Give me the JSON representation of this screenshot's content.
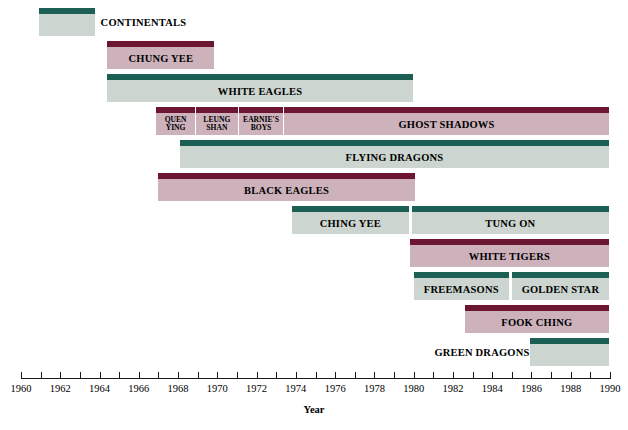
{
  "chart_data": {
    "type": "bar",
    "orientation": "horizontal-timeline",
    "title": "",
    "xlabel": "Year",
    "ylabel": "",
    "xlim": [
      1960,
      1990
    ],
    "grid": false,
    "legend": null,
    "tick_step": 1,
    "label_step": 2,
    "tick_labels": [
      "1960",
      "1961",
      "1962",
      "1963",
      "1964",
      "1965",
      "1966",
      "1967",
      "1968",
      "1969",
      "1970",
      "1971",
      "1972",
      "1973",
      "1974",
      "1975",
      "1976",
      "1977",
      "1978",
      "1979",
      "1980",
      "1981",
      "1982",
      "1983",
      "1984",
      "1985",
      "1986",
      "1987",
      "1988",
      "1989",
      "1990"
    ],
    "visible_tick_labels": [
      "1960",
      "1962",
      "1964",
      "1966",
      "1968",
      "1970",
      "1972",
      "1974",
      "1976",
      "1978",
      "1980",
      "1982",
      "1984",
      "1986",
      "1988",
      "1990"
    ],
    "colors": {
      "green_cap": "#1c5f54",
      "green_body": "#ccd5cf",
      "maroon_cap": "#6c1631",
      "maroon_body": "#cdb2bb",
      "axis": "#1a1a1a",
      "text": "#000000",
      "background": "#ffffff"
    },
    "rows": [
      {
        "row": 0,
        "segments": [
          {
            "label": "CONTINENTALS",
            "start": 1960.9,
            "end": 1963.8,
            "color": "green",
            "label_position": "right-outside",
            "label_size": "normal"
          }
        ]
      },
      {
        "row": 1,
        "segments": [
          {
            "label": "CHUNG YEE",
            "start": 1964.4,
            "end": 1969.9,
            "color": "maroon",
            "label_position": "inside",
            "label_size": "normal"
          }
        ]
      },
      {
        "row": 2,
        "segments": [
          {
            "label": "WHITE EAGLES",
            "start": 1964.4,
            "end": 1980.0,
            "color": "green",
            "label_position": "inside",
            "label_size": "normal"
          }
        ]
      },
      {
        "row": 3,
        "segments": [
          {
            "label": "QUEN YING",
            "start": 1966.9,
            "end": 1968.9,
            "color": "maroon",
            "label_position": "inside",
            "label_size": "small",
            "label_lines": [
              "QUEN",
              "YING"
            ]
          },
          {
            "label": "LEUNG SHAN",
            "start": 1968.9,
            "end": 1971.1,
            "color": "maroon",
            "label_position": "inside",
            "label_size": "small",
            "label_lines": [
              "LEUNG",
              "SHAN"
            ]
          },
          {
            "label": "EARNIE'S BOYS",
            "start": 1971.1,
            "end": 1973.4,
            "color": "maroon",
            "label_position": "inside",
            "label_size": "small",
            "label_lines": [
              "EARNIE'S",
              "BOYS"
            ]
          },
          {
            "label": "GHOST SHADOWS",
            "start": 1973.4,
            "end": 1990.0,
            "color": "maroon",
            "label_position": "inside",
            "label_size": "normal"
          }
        ]
      },
      {
        "row": 4,
        "segments": [
          {
            "label": "FLYING DRAGONS",
            "start": 1968.1,
            "end": 1990.0,
            "color": "green",
            "label_position": "inside",
            "label_size": "normal"
          }
        ]
      },
      {
        "row": 5,
        "segments": [
          {
            "label": "BLACK EAGLES",
            "start": 1967.0,
            "end": 1980.1,
            "color": "maroon",
            "label_position": "inside",
            "label_size": "normal"
          }
        ]
      },
      {
        "row": 6,
        "segments": [
          {
            "label": "CHING YEE",
            "start": 1973.8,
            "end": 1979.8,
            "color": "green",
            "label_position": "inside",
            "label_size": "normal"
          },
          {
            "label": "TUNG ON",
            "start": 1979.9,
            "end": 1990.0,
            "color": "green",
            "label_position": "inside",
            "label_size": "normal"
          }
        ]
      },
      {
        "row": 7,
        "segments": [
          {
            "label": "WHITE TIGERS",
            "start": 1979.8,
            "end": 1990.0,
            "color": "maroon",
            "label_position": "inside",
            "label_size": "normal"
          }
        ]
      },
      {
        "row": 8,
        "segments": [
          {
            "label": "FREEMASONS",
            "start": 1980.0,
            "end": 1984.9,
            "color": "green",
            "label_position": "inside",
            "label_size": "normal"
          },
          {
            "label": "GOLDEN STAR",
            "start": 1985.0,
            "end": 1990.0,
            "color": "green",
            "label_position": "inside",
            "label_size": "normal"
          }
        ]
      },
      {
        "row": 9,
        "segments": [
          {
            "label": "FOOK CHING",
            "start": 1982.6,
            "end": 1990.0,
            "color": "maroon",
            "label_position": "inside",
            "label_size": "normal"
          }
        ]
      },
      {
        "row": 10,
        "segments": [
          {
            "label": "GREEN DRAGONS",
            "start": 1985.9,
            "end": 1990.0,
            "color": "green",
            "label_position": "left-outside",
            "label_size": "normal"
          }
        ]
      }
    ]
  },
  "axis": {
    "title": "Year"
  }
}
